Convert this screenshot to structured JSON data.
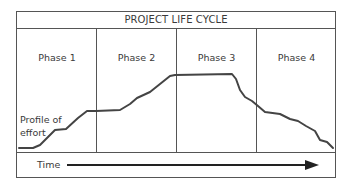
{
  "diagram": {
    "title": "PROJECT LIFE CYCLE",
    "phases": [
      {
        "label": "Phase 1"
      },
      {
        "label": "Phase 2"
      },
      {
        "label": "Phase 3"
      },
      {
        "label": "Phase 4"
      }
    ],
    "curve_label_line1": "Profile of",
    "curve_label_line2": "effort",
    "axis_label": "Time",
    "colors": {
      "line": "#444444",
      "border": "#555555",
      "text": "#3a3a3a"
    },
    "effort_profile_points": [
      [
        19,
        148
      ],
      [
        33,
        148
      ],
      [
        40,
        145
      ],
      [
        48,
        137
      ],
      [
        55,
        130
      ],
      [
        66,
        129
      ],
      [
        78,
        118
      ],
      [
        87,
        111
      ],
      [
        96,
        111
      ],
      [
        120,
        110
      ],
      [
        130,
        104
      ],
      [
        137,
        98
      ],
      [
        150,
        92
      ],
      [
        160,
        84
      ],
      [
        170,
        76
      ],
      [
        175,
        75
      ],
      [
        232,
        74
      ],
      [
        236,
        79
      ],
      [
        240,
        90
      ],
      [
        245,
        97
      ],
      [
        252,
        101
      ],
      [
        258,
        106
      ],
      [
        265,
        112
      ],
      [
        280,
        114
      ],
      [
        290,
        119
      ],
      [
        298,
        121
      ],
      [
        306,
        126
      ],
      [
        315,
        131
      ],
      [
        320,
        140
      ],
      [
        327,
        142
      ],
      [
        333,
        148
      ]
    ]
  }
}
